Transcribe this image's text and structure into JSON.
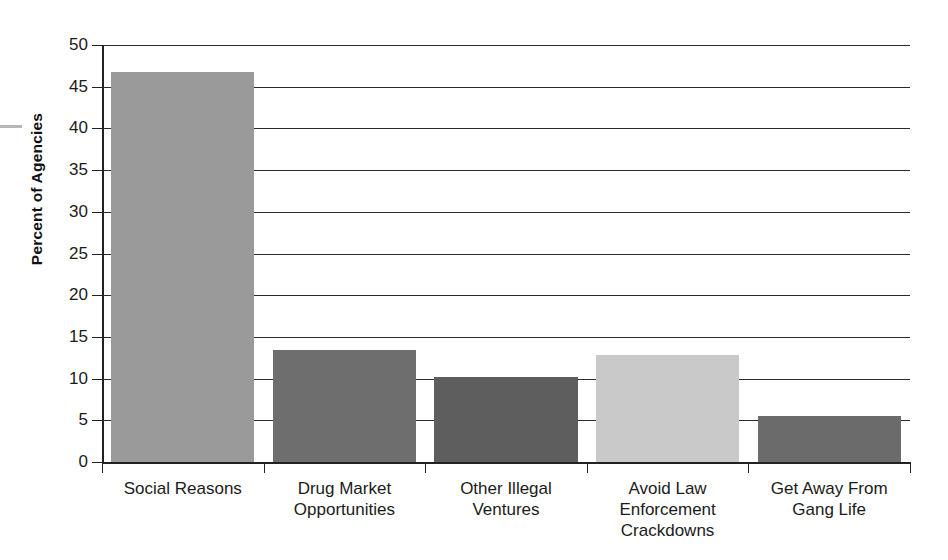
{
  "chart_data": {
    "type": "bar",
    "title": "",
    "xlabel": "",
    "ylabel": "Percent of Agencies",
    "ylim": [
      0,
      50
    ],
    "ytick_step": 5,
    "yticks": [
      0,
      5,
      10,
      15,
      20,
      25,
      30,
      35,
      40,
      45,
      50
    ],
    "ytick_labels": [
      "0",
      "5",
      "10",
      "15",
      "20",
      "25",
      "30",
      "35",
      "40",
      "45",
      "50"
    ],
    "grid": true,
    "grid_axis": "y",
    "legend": false,
    "categories": [
      "Social Reasons",
      "Drug Market Opportunities",
      "Other Illegal Ventures",
      "Avoid Law Enforcement Crackdowns",
      "Get Away From Gang Life"
    ],
    "category_label_lines": [
      [
        "Social Reasons"
      ],
      [
        "Drug Market",
        "Opportunities"
      ],
      [
        "Other Illegal",
        "Ventures"
      ],
      [
        "Avoid Law",
        "Enforcement",
        "Crackdowns"
      ],
      [
        "Get Away From",
        "Gang Life"
      ]
    ],
    "values": [
      46.8,
      13.4,
      10.2,
      12.8,
      5.5
    ],
    "bar_colors": [
      "#9a9a9a",
      "#6e6e6e",
      "#5e5e5e",
      "#c9c9c9",
      "#6b6b6b"
    ]
  },
  "axes": {
    "y_title": "Percent of Agencies"
  }
}
